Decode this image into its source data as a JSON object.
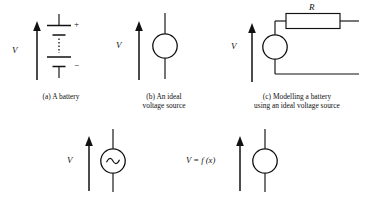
{
  "figure": {
    "background": "#ffffff",
    "line_color": "#111111"
  },
  "panels": [
    {
      "id": "a",
      "name": "battery",
      "caption_line1": "(a) A battery",
      "caption_line2": "",
      "voltage_label": "V",
      "plus_sign": "+",
      "minus_sign": "−",
      "symbol": "battery-multicell-dotted"
    },
    {
      "id": "b",
      "name": "ideal-voltage-source",
      "caption_line1": "(b) An ideal",
      "caption_line2": "voltage source",
      "voltage_label": "V",
      "symbol": "circle-source"
    },
    {
      "id": "c",
      "name": "battery-model",
      "caption_line1": "(c) Modelling a battery",
      "caption_line2": "using an ideal voltage source",
      "voltage_label": "V",
      "resistor_label": "R",
      "symbol": "circle-source-with-series-resistor"
    },
    {
      "id": "d",
      "name": "ac-voltage-source",
      "caption_line1": "",
      "caption_line2": "",
      "voltage_label": "V",
      "inner_glyph": "sine-wave",
      "symbol": "circle-source-ac"
    },
    {
      "id": "e",
      "name": "functional-voltage-source",
      "caption_line1": "",
      "caption_line2": "",
      "voltage_label": "V = f (x)",
      "symbol": "circle-source"
    }
  ]
}
